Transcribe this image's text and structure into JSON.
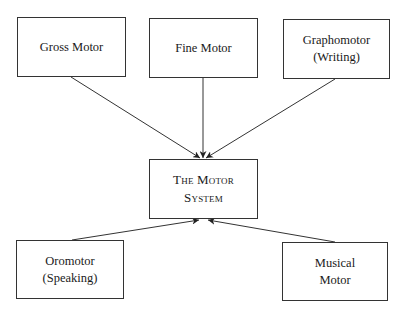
{
  "diagram": {
    "nodes": {
      "gross": {
        "line1": "Gross Motor",
        "line2": ""
      },
      "fine": {
        "line1": "Fine Motor",
        "line2": ""
      },
      "grapho": {
        "line1": "Graphomotor",
        "line2": "(Writing)"
      },
      "center": {
        "line1": "The Motor",
        "line2": "System"
      },
      "oro": {
        "line1": "Oromotor",
        "line2": "(Speaking)"
      },
      "musical": {
        "line1": "Musical",
        "line2": "Motor"
      }
    },
    "edges": [
      {
        "from": "gross",
        "to": "center"
      },
      {
        "from": "fine",
        "to": "center"
      },
      {
        "from": "grapho",
        "to": "center"
      },
      {
        "from": "oro",
        "to": "center"
      },
      {
        "from": "musical",
        "to": "center"
      }
    ],
    "colors": {
      "line": "#333333",
      "border": "#333333",
      "background": "#ffffff"
    }
  }
}
